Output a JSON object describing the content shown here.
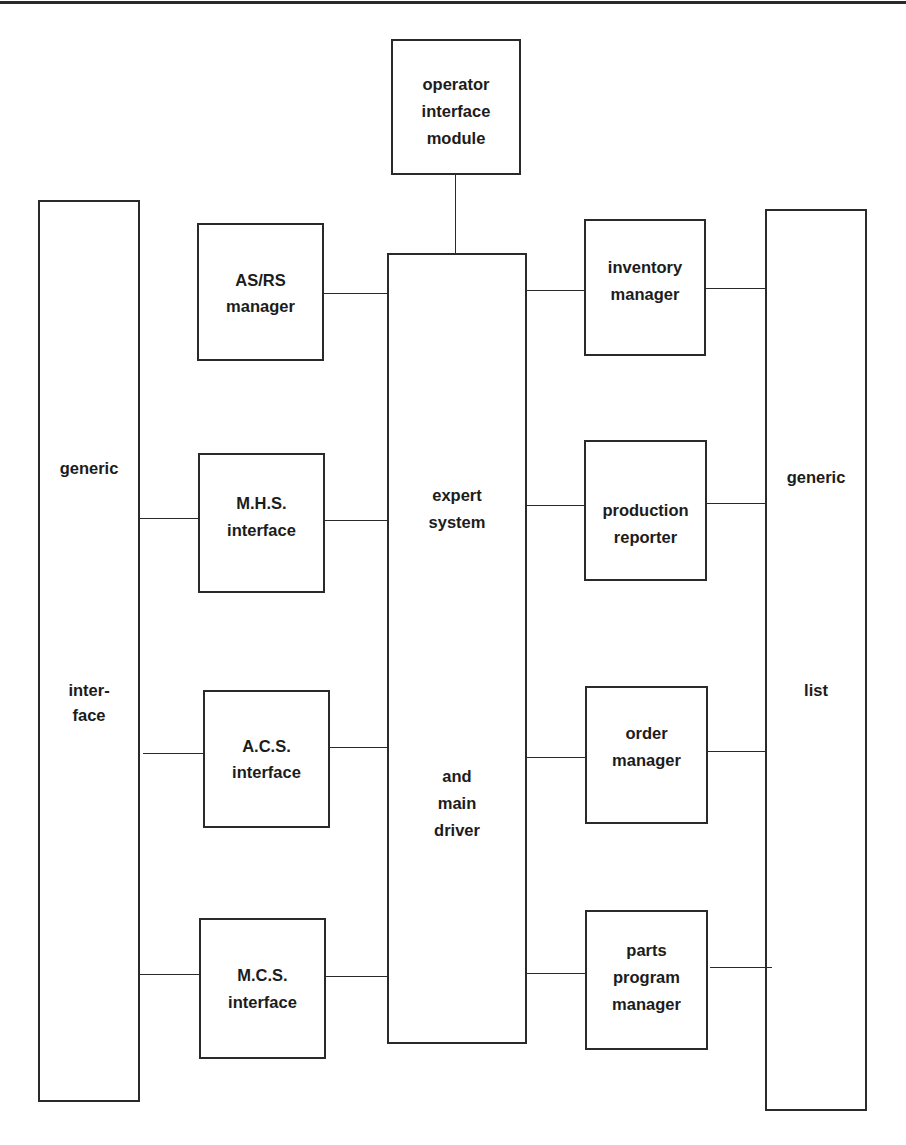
{
  "diagram": {
    "operator_module": {
      "lines": [
        "operator",
        "interface",
        "module"
      ]
    },
    "left_column": {
      "top_label": "generic",
      "bottom_lines": [
        "inter-",
        "face"
      ]
    },
    "right_column": {
      "top_label": "generic",
      "bottom_label": "list"
    },
    "center": {
      "top_lines": [
        "expert",
        "system"
      ],
      "bottom_lines": [
        "and",
        "main",
        "driver"
      ]
    },
    "left_modules": [
      {
        "lines": [
          "AS/RS",
          "manager"
        ]
      },
      {
        "lines": [
          "M.H.S.",
          "interface"
        ]
      },
      {
        "lines": [
          "A.C.S.",
          "interface"
        ]
      },
      {
        "lines": [
          "M.C.S.",
          "interface"
        ]
      }
    ],
    "right_modules": [
      {
        "lines": [
          "inventory",
          "manager"
        ]
      },
      {
        "lines": [
          "production",
          "reporter"
        ]
      },
      {
        "lines": [
          "order",
          "manager"
        ]
      },
      {
        "lines": [
          "parts",
          "program",
          "manager"
        ]
      }
    ],
    "colors": {
      "line": "#2a2a2a",
      "background": "#ffffff",
      "text": "#1c1c1c"
    }
  }
}
